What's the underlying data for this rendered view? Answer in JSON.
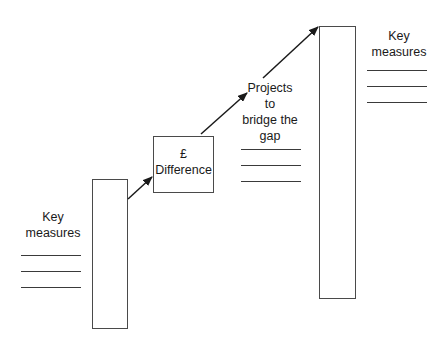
{
  "diagram": {
    "left_group": {
      "title_line1": "Key",
      "title_line2": "measures",
      "blank_lines": 3
    },
    "difference_box": {
      "symbol": "£",
      "label": "Difference"
    },
    "projects": {
      "line1": "Projects",
      "line2": "to",
      "line3": "bridge the",
      "line4": "gap",
      "blank_lines": 3
    },
    "right_group": {
      "title_line1": "Key",
      "title_line2": "measures",
      "blank_lines": 3
    },
    "colors": {
      "stroke": "#4a4a4a",
      "text": "#1a1a1a",
      "background": "#ffffff"
    }
  }
}
